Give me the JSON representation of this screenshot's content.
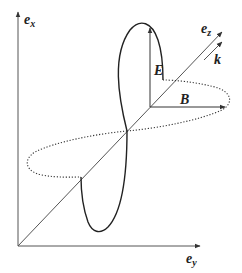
{
  "figure": {
    "labels": {
      "ex": {
        "main": "e",
        "sub": "x"
      },
      "ey": {
        "main": "e",
        "sub": "y"
      },
      "ez": {
        "main": "e",
        "sub": "z"
      },
      "k": "k",
      "E": "E",
      "B": "B"
    },
    "colors": {
      "axis": "#555555",
      "wave": "#222222",
      "text": "#222222",
      "background": "#ffffff"
    }
  }
}
